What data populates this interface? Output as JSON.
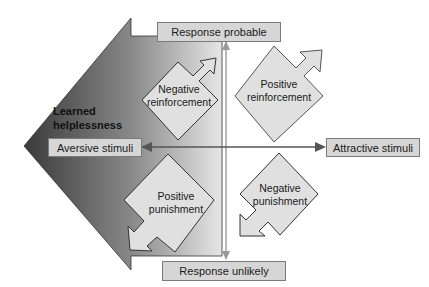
{
  "diagram": {
    "top_label": "Response probable",
    "bottom_label": "Response unlikely",
    "left_label": "Aversive stimuli",
    "right_label": "Attractive stimuli",
    "region_label_line1": "Learned",
    "region_label_line2": "helplessness",
    "quadrants": [
      {
        "line1": "Negative",
        "line2": "reinforcement",
        "arrow": "up-right"
      },
      {
        "line1": "Positive",
        "line2": "reinforcement",
        "arrow": "up-right"
      },
      {
        "line1": "Positive",
        "line2": "punishment",
        "arrow": "down-left"
      },
      {
        "line1": "Negative",
        "line2": "punishment",
        "arrow": "down-left"
      }
    ],
    "colors": {
      "dark_gradient_start": "#3a3a3a",
      "dark_gradient_end": "#e8e8e8",
      "box_fill": "#d6d6d6",
      "diamond_fill": "#e0e0e0",
      "axis_line": "#555555"
    }
  }
}
